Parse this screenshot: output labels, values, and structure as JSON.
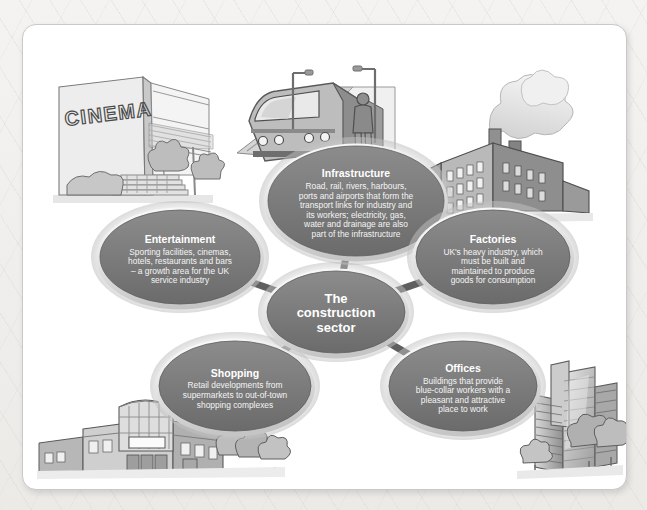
{
  "diagram": {
    "center": {
      "id": "center",
      "label_lines": [
        "The",
        "construction",
        "sector"
      ],
      "cx": 313,
      "cy": 287,
      "rx": 69,
      "ry": 41
    },
    "fill_color": "#7b7b7b",
    "fill_color_dark": "#6a6a6a",
    "ring_color": "#d9d9d9",
    "connector_color": "#5f5f5f",
    "title_color": "#ffffff",
    "body_color": "#f2f2f2",
    "nodes": [
      {
        "id": "infrastructure",
        "title": "Infrastructure",
        "body_lines": [
          "Road, rail, rivers, harbours,",
          "ports and airports that form the",
          "transport links for industry and",
          "its workers; electricity, gas,",
          "water and drainage are also",
          "part of the infrastructure"
        ],
        "cx": 333,
        "cy": 176,
        "rx": 88,
        "ry": 55
      },
      {
        "id": "factories",
        "title": "Factories",
        "body_lines": [
          "UK's heavy industry, which",
          "must be built and",
          "maintained to produce",
          "goods for consumption"
        ],
        "cx": 470,
        "cy": 232,
        "rx": 77,
        "ry": 47
      },
      {
        "id": "entertainment",
        "title": "Entertainment",
        "body_lines": [
          "Sporting facilities, cinemas,",
          "hotels, restaurants and bars",
          "– a growth area for the UK",
          "service industry"
        ],
        "cx": 157,
        "cy": 232,
        "rx": 80,
        "ry": 47
      },
      {
        "id": "shopping",
        "title": "Shopping",
        "body_lines": [
          "Retail developments from",
          "supermarkets to out-of-town",
          "shopping complexes"
        ],
        "cx": 212,
        "cy": 361,
        "rx": 76,
        "ry": 45
      },
      {
        "id": "offices",
        "title": "Offices",
        "body_lines": [
          "Buildings that provide",
          "blue-collar workers with a",
          "pleasant and attractive",
          "place to work"
        ],
        "cx": 440,
        "cy": 361,
        "rx": 74,
        "ry": 45
      }
    ],
    "connectors": [
      {
        "from": "center",
        "to": "infrastructure"
      },
      {
        "from": "center",
        "to": "factories"
      },
      {
        "from": "center",
        "to": "entertainment"
      },
      {
        "from": "center",
        "to": "shopping"
      },
      {
        "from": "center",
        "to": "offices"
      }
    ],
    "illustrations": [
      {
        "id": "cinema",
        "name": "cinema-building-illustration",
        "signage": "CINEMA"
      },
      {
        "id": "train",
        "name": "train-platform-illustration",
        "signage": ""
      },
      {
        "id": "factory",
        "name": "factory-smokestacks-illustration",
        "signage": ""
      },
      {
        "id": "office-towers",
        "name": "office-towers-illustration",
        "signage": ""
      },
      {
        "id": "retail-park",
        "name": "retail-park-illustration",
        "signage": ""
      }
    ]
  }
}
